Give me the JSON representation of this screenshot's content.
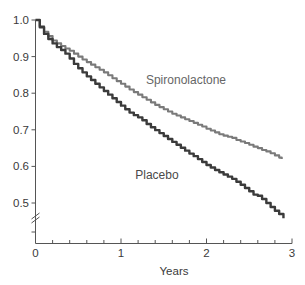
{
  "chart_data": {
    "type": "line",
    "title": "",
    "xlabel": "Years",
    "ylabel": "",
    "xlim": [
      0,
      3
    ],
    "ylim": [
      0.44,
      1.0
    ],
    "y_axis_break": true,
    "grid": false,
    "legend_position": "inline-annotation",
    "x_ticks": [
      0,
      1,
      2,
      3
    ],
    "x_tick_labels": [
      "0",
      "1",
      "2",
      "3"
    ],
    "x_minor_ticks": [
      0.2,
      0.4,
      0.6,
      0.8,
      1.2,
      1.4,
      1.6,
      1.8,
      2.2,
      2.4,
      2.6,
      2.8
    ],
    "y_ticks": [
      0.5,
      0.6,
      0.7,
      0.8,
      0.9,
      1.0
    ],
    "y_tick_labels": [
      "0.5",
      "0.6",
      "0.7",
      "0.8",
      "0.9",
      "1.0"
    ],
    "series": [
      {
        "name": "Spironolactone",
        "color": "#7a7a7a",
        "label_x": 1.76,
        "label_y": 0.825,
        "x": [
          0.0,
          0.05,
          0.1,
          0.15,
          0.2,
          0.25,
          0.3,
          0.35,
          0.4,
          0.45,
          0.5,
          0.55,
          0.6,
          0.65,
          0.7,
          0.75,
          0.8,
          0.85,
          0.9,
          0.95,
          1.0,
          1.05,
          1.1,
          1.15,
          1.2,
          1.25,
          1.3,
          1.35,
          1.4,
          1.45,
          1.5,
          1.55,
          1.6,
          1.65,
          1.7,
          1.75,
          1.8,
          1.85,
          1.9,
          1.95,
          2.0,
          2.05,
          2.1,
          2.15,
          2.2,
          2.25,
          2.3,
          2.35,
          2.4,
          2.45,
          2.5,
          2.55,
          2.6,
          2.65,
          2.7,
          2.75,
          2.8,
          2.85,
          2.88
        ],
        "y": [
          1.0,
          0.983,
          0.968,
          0.956,
          0.944,
          0.936,
          0.929,
          0.922,
          0.916,
          0.908,
          0.9,
          0.892,
          0.885,
          0.878,
          0.871,
          0.864,
          0.857,
          0.849,
          0.841,
          0.833,
          0.826,
          0.818,
          0.81,
          0.803,
          0.796,
          0.789,
          0.782,
          0.775,
          0.768,
          0.762,
          0.756,
          0.75,
          0.744,
          0.739,
          0.734,
          0.729,
          0.724,
          0.719,
          0.714,
          0.709,
          0.703,
          0.698,
          0.693,
          0.688,
          0.684,
          0.681,
          0.678,
          0.672,
          0.668,
          0.664,
          0.659,
          0.654,
          0.65,
          0.645,
          0.641,
          0.636,
          0.63,
          0.624,
          0.62
        ]
      },
      {
        "name": "Placebo",
        "color": "#3b3b3b",
        "label_x": 1.42,
        "label_y": 0.565,
        "x": [
          0.0,
          0.05,
          0.1,
          0.15,
          0.2,
          0.25,
          0.3,
          0.35,
          0.4,
          0.45,
          0.5,
          0.55,
          0.6,
          0.65,
          0.7,
          0.75,
          0.8,
          0.85,
          0.9,
          0.95,
          1.0,
          1.05,
          1.1,
          1.15,
          1.2,
          1.25,
          1.3,
          1.35,
          1.4,
          1.45,
          1.5,
          1.55,
          1.6,
          1.65,
          1.7,
          1.75,
          1.8,
          1.85,
          1.9,
          1.95,
          2.0,
          2.05,
          2.1,
          2.15,
          2.2,
          2.25,
          2.3,
          2.35,
          2.4,
          2.45,
          2.5,
          2.55,
          2.6,
          2.65,
          2.7,
          2.75,
          2.8,
          2.85,
          2.9
        ],
        "y": [
          1.0,
          0.98,
          0.962,
          0.948,
          0.936,
          0.926,
          0.918,
          0.908,
          0.895,
          0.88,
          0.868,
          0.857,
          0.846,
          0.836,
          0.826,
          0.816,
          0.806,
          0.796,
          0.786,
          0.776,
          0.766,
          0.756,
          0.747,
          0.74,
          0.734,
          0.726,
          0.716,
          0.707,
          0.699,
          0.691,
          0.683,
          0.675,
          0.667,
          0.659,
          0.651,
          0.643,
          0.635,
          0.628,
          0.62,
          0.612,
          0.604,
          0.597,
          0.59,
          0.584,
          0.578,
          0.572,
          0.566,
          0.558,
          0.55,
          0.541,
          0.532,
          0.523,
          0.52,
          0.511,
          0.5,
          0.489,
          0.479,
          0.47,
          0.458
        ]
      }
    ]
  },
  "axis": {
    "x_title": "Years"
  }
}
